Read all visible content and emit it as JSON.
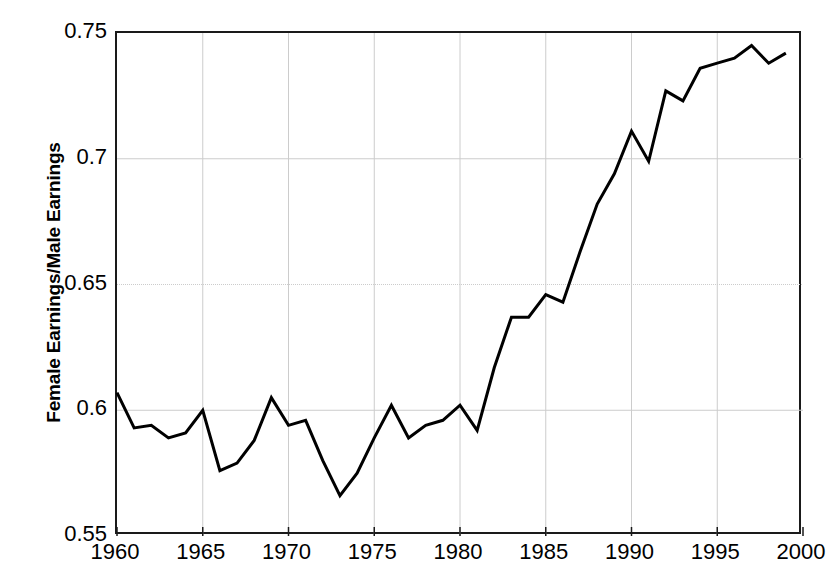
{
  "chart": {
    "type": "line",
    "ylabel": "Female Earnings/Male Earnings",
    "xlabel": "",
    "title": "",
    "yticks": [
      "0.55",
      "0.6",
      "0.65",
      "0.7",
      "0.75"
    ],
    "xticks": [
      "1960",
      "1965",
      "1970",
      "1975",
      "1980",
      "1985",
      "1990",
      "1995",
      "2000"
    ],
    "line_color": "#000000",
    "axis_color": "#1a1a1a",
    "grid_color": "#cccccc",
    "background": "#ffffff"
  },
  "chart_data": {
    "type": "line",
    "title": "",
    "xlabel": "",
    "ylabel": "Female Earnings/Male Earnings",
    "xlim": [
      1960,
      2000
    ],
    "ylim": [
      0.55,
      0.75
    ],
    "yticks": [
      0.55,
      0.6,
      0.65,
      0.7,
      0.75
    ],
    "xticks": [
      1960,
      1965,
      1970,
      1975,
      1980,
      1985,
      1990,
      1995,
      2000
    ],
    "grid": true,
    "legend": null,
    "series": [
      {
        "name": "Female Earnings/Male Earnings",
        "color": "#000000",
        "x": [
          1960,
          1961,
          1962,
          1963,
          1964,
          1965,
          1966,
          1967,
          1968,
          1969,
          1970,
          1971,
          1972,
          1973,
          1974,
          1975,
          1976,
          1977,
          1978,
          1979,
          1980,
          1981,
          1982,
          1983,
          1984,
          1985,
          1986,
          1987,
          1988,
          1989,
          1990,
          1991,
          1992,
          1993,
          1994,
          1995,
          1996,
          1997,
          1998,
          1999
        ],
        "values": [
          0.607,
          0.593,
          0.594,
          0.589,
          0.591,
          0.6,
          0.576,
          0.579,
          0.588,
          0.605,
          0.594,
          0.596,
          0.58,
          0.566,
          0.575,
          0.589,
          0.602,
          0.589,
          0.594,
          0.596,
          0.602,
          0.592,
          0.617,
          0.637,
          0.637,
          0.646,
          0.643,
          0.663,
          0.682,
          0.694,
          0.711,
          0.699,
          0.727,
          0.723,
          0.736,
          0.738,
          0.74,
          0.745,
          0.738,
          0.742
        ]
      }
    ]
  }
}
